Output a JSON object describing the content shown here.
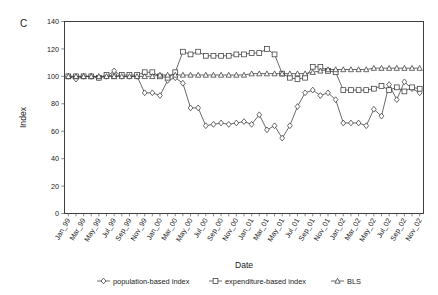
{
  "figure": {
    "panel_label": "C",
    "xlabel": "Date",
    "ylabel": "Index"
  },
  "chart_data": {
    "type": "line",
    "title": "",
    "panel": "C",
    "xlabel": "Date",
    "ylabel": "Index",
    "ylim": [
      0,
      140
    ],
    "ytick_step": 20,
    "yticks": [
      0,
      20,
      40,
      60,
      80,
      100,
      120,
      140
    ],
    "grid": false,
    "legend_position": "bottom",
    "x_tick_labels_every": 2,
    "x": [
      "Jan_99",
      "Feb_99",
      "Mar_99",
      "Apr_99",
      "May_99",
      "Jun_99",
      "Jul_99",
      "Aug_99",
      "Sep_99",
      "Oct_99",
      "Nov_99",
      "Dec_99",
      "Jan_00",
      "Feb_00",
      "Mar_00",
      "Apr_00",
      "May_00",
      "Jun_00",
      "Jul_00",
      "Aug_00",
      "Sep_00",
      "Oct_00",
      "Nov_00",
      "Dec_00",
      "Jan_01",
      "Feb_01",
      "Mar_01",
      "Apr_01",
      "May_01",
      "Jun_01",
      "Jul_01",
      "Aug_01",
      "Sep_01",
      "Oct_01",
      "Nov_01",
      "Dec_01",
      "Jan_02",
      "Feb_02",
      "Mar_02",
      "Apr_02",
      "May_02",
      "Jun_02",
      "Jul_02",
      "Aug_02",
      "Sep_02",
      "Oct_02",
      "Nov_02"
    ],
    "x_tick_labels": [
      "Jan_99",
      "Mar_99",
      "May_99",
      "Jul_99",
      "Sep_99",
      "Nov_99",
      "Jan_00",
      "Mar_00",
      "May_00",
      "Jul_00",
      "Sep_00",
      "Nov_00",
      "Jan_01",
      "Mar_01",
      "May_01",
      "Jul_01",
      "Sep_01",
      "Nov_01",
      "Jan_02",
      "Mar_02",
      "May_02",
      "Jul_02",
      "Sep_02",
      "Nov_02"
    ],
    "series": [
      {
        "name": "population-based index",
        "marker": "diamond",
        "values": [
          100,
          98,
          100,
          100,
          99,
          100,
          104,
          100,
          100,
          100,
          88,
          88,
          86,
          97,
          99,
          95,
          77,
          77,
          64,
          65,
          66,
          65,
          66,
          67,
          65,
          72,
          61,
          64,
          55,
          64,
          78,
          88,
          90,
          86,
          88,
          83,
          66,
          66,
          66,
          64,
          76,
          71,
          94,
          83,
          96,
          91,
          88
        ]
      },
      {
        "name": "expenditure-based index",
        "marker": "square",
        "values": [
          100,
          100,
          100,
          100,
          99,
          101,
          100,
          101,
          101,
          101,
          103,
          103,
          100,
          99,
          103,
          118,
          116,
          118,
          115,
          115,
          115,
          115,
          116,
          116,
          117,
          117,
          120,
          116,
          102,
          99,
          98,
          99,
          107,
          107,
          104,
          103,
          90,
          90,
          90,
          90,
          91,
          93,
          90,
          92,
          89,
          92,
          91
        ]
      },
      {
        "name": "BLS",
        "marker": "triangle",
        "values": [
          100,
          100,
          100,
          100,
          100,
          100,
          100,
          100,
          100,
          100,
          100,
          100,
          101,
          101,
          101,
          101,
          101,
          101,
          101,
          101,
          101,
          101,
          101,
          101,
          102,
          102,
          102,
          102,
          102,
          102,
          102,
          102,
          103,
          104,
          105,
          105,
          105,
          105,
          105,
          105,
          106,
          106,
          106,
          106,
          106,
          106,
          106
        ]
      }
    ]
  },
  "legend": {
    "items": [
      {
        "label": "population-based index",
        "marker": "diamond"
      },
      {
        "label": "expenditure-based index",
        "marker": "square"
      },
      {
        "label": "BLS",
        "marker": "triangle"
      }
    ]
  }
}
